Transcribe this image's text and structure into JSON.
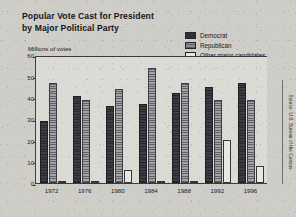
{
  "title": {
    "line1": "Popular Vote Cast for President",
    "line2": "by Major Political Party"
  },
  "axis_label": "Millions of votes",
  "legend": {
    "items": [
      {
        "label": "Democrat",
        "color": "#2f2f36"
      },
      {
        "label": "Republican",
        "color": "#8d8d92"
      },
      {
        "label": "Other major candidates",
        "color": "#e8e6e1"
      }
    ]
  },
  "source": "Source: U.S. Bureau of the Census",
  "yticks": [
    "0",
    "10",
    "20",
    "30",
    "40",
    "50",
    "60"
  ],
  "chart_data": {
    "type": "bar",
    "title": "Popular Vote Cast for President by Major Political Party",
    "xlabel": "",
    "ylabel": "Millions of votes",
    "ylim": [
      0,
      60
    ],
    "ytick_step": 10,
    "grid": false,
    "legend_position": "top-right",
    "categories": [
      "1972",
      "1976",
      "1980",
      "1984",
      "1988",
      "1992",
      "1996"
    ],
    "series": [
      {
        "name": "Democrat",
        "color": "#2f2f36",
        "values": [
          29,
          41,
          36,
          37,
          42,
          45,
          47
        ]
      },
      {
        "name": "Republican",
        "color": "#8d8d92",
        "values": [
          47,
          39,
          44,
          54,
          47,
          39,
          39
        ]
      },
      {
        "name": "Other major candidates",
        "color": "#e8e6e1",
        "values": [
          1.1,
          1.0,
          6,
          0.7,
          0.9,
          20,
          8
        ]
      }
    ]
  }
}
